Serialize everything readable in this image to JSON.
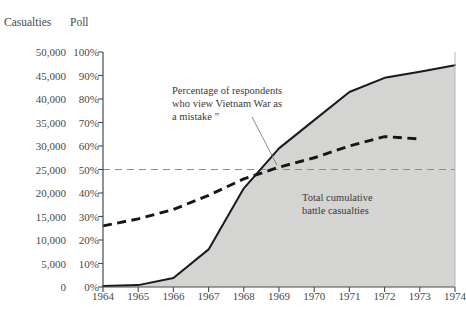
{
  "header": {
    "casualties_label": "Casualties",
    "poll_label": "Poll"
  },
  "axes": {
    "casualties_ticks": [
      "50,000",
      "45,000",
      "40,000",
      "35,000",
      "30,000",
      "25,000",
      "20,000",
      "15,000",
      "10,000",
      "5,000",
      "0"
    ],
    "poll_ticks": [
      "100%",
      "90%",
      "80%",
      "70%",
      "60%",
      "50%",
      "40%",
      "30%",
      "20%",
      "10%",
      "0%"
    ],
    "year_ticks": [
      "1964",
      "1965",
      "1966",
      "1967",
      "1968",
      "1969",
      "1970",
      "1971",
      "1972",
      "1973",
      "1974"
    ]
  },
  "annotations": {
    "poll_line_1": "Percentage of respondents",
    "poll_line_2": "who view Vietnam War as",
    "poll_line_3": "a mistake ”",
    "casualties_line_1": "Total cumulative",
    "casualties_line_2": "battle casualties"
  },
  "colors": {
    "area_fill": "#d4d4d2",
    "curve_stroke": "#1a1a1a",
    "poll_dash": "#161616",
    "reference_dash": "#8d8d8b",
    "axis": "#4a4a48",
    "text": "#3a3a38"
  },
  "chart_data": {
    "type": "area",
    "title": "",
    "xlabel": "",
    "ylabel": "Casualties",
    "y2label": "Poll",
    "grid": false,
    "legend": "none",
    "x": [
      1964,
      1965,
      1966,
      1967,
      1968,
      1969,
      1970,
      1971,
      1972,
      1973,
      1974
    ],
    "xlim": [
      1964,
      1974
    ],
    "ylim": [
      0,
      50000
    ],
    "y2lim": [
      0,
      100
    ],
    "series": [
      {
        "name": "Total cumulative battle casualties",
        "type": "area",
        "axis": "left",
        "unit": "casualties",
        "values": [
          200,
          400,
          1900,
          8000,
          21000,
          29500,
          35500,
          41500,
          44500,
          45800,
          47200
        ]
      },
      {
        "name": "Percentage of respondents who view Vietnam War as a mistake",
        "type": "line",
        "style": "dashed",
        "axis": "right",
        "unit": "percent",
        "x": [
          1964,
          1965,
          1966,
          1967,
          1968,
          1969,
          1970,
          1971,
          1972,
          1973
        ],
        "values": [
          26,
          29,
          33,
          39,
          46,
          51,
          55,
          60,
          64,
          63
        ]
      }
    ],
    "reference_lines": [
      {
        "name": "50 percent reference",
        "axis": "right",
        "value": 50,
        "style": "dashed"
      }
    ],
    "annotations": [
      {
        "text": "Percentage of respondents who view Vietnam War as a mistake",
        "points_to_year": 1969,
        "points_to_value": 51
      },
      {
        "text": "Total cumulative battle casualties",
        "points_to_year": 1971,
        "points_to_value": 30000
      }
    ]
  }
}
